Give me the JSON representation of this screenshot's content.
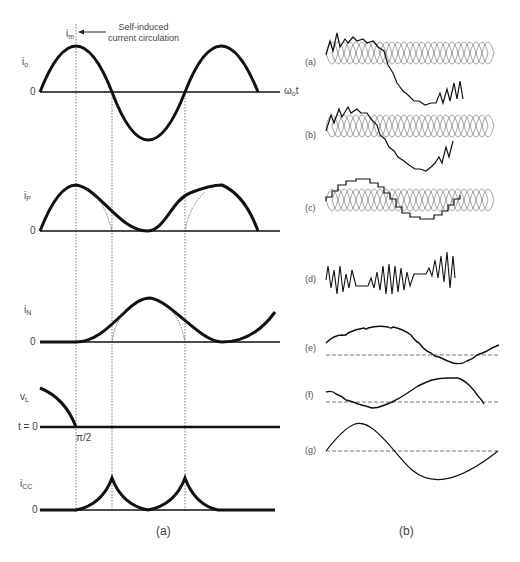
{
  "figure": {
    "left_panel": {
      "caption": "(a)",
      "annotation": {
        "symbol": "i",
        "symbol_sub": "m",
        "text_line1": "Self-induced",
        "text_line2": "current circulation"
      },
      "axis_label_x": {
        "symbol": "ω",
        "sub": "o",
        "suffix": "t"
      },
      "plots": [
        {
          "id": "io",
          "symbol": "i",
          "sub": "o",
          "zero": "0"
        },
        {
          "id": "ip",
          "symbol": "i",
          "sub": "P",
          "zero": "0"
        },
        {
          "id": "in",
          "symbol": "i",
          "sub": "N",
          "zero": "0"
        },
        {
          "id": "vl",
          "symbol": "v",
          "sub": "L",
          "zero": "t = 0",
          "marker": "π/2"
        },
        {
          "id": "icc",
          "symbol": "i",
          "sub": "CC",
          "zero": "0"
        }
      ]
    },
    "right_panel": {
      "caption": "(b)",
      "plots": [
        {
          "id": "a",
          "label": "(a)"
        },
        {
          "id": "b",
          "label": "(b)"
        },
        {
          "id": "c",
          "label": "(c)"
        },
        {
          "id": "d",
          "label": "(d)"
        },
        {
          "id": "e",
          "label": "(e)"
        },
        {
          "id": "f",
          "label": "(f)"
        },
        {
          "id": "g",
          "label": "(g)"
        }
      ]
    },
    "colors": {
      "curve": "#111111",
      "axis": "#111111",
      "guide": "#555555",
      "text": "#444444"
    }
  }
}
